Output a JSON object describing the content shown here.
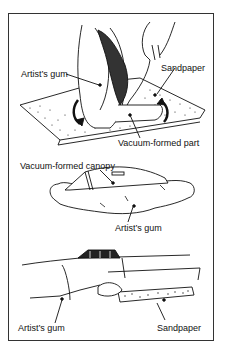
{
  "figure": {
    "panels": [
      {
        "id": "panel-1",
        "description": "Hands holding a vacuum-formed part with artist's gum and rubbing it on sandpaper",
        "labels": [
          {
            "text": "Artist’s gum"
          },
          {
            "text": "Sandpaper"
          },
          {
            "text": "Vacuum-formed part"
          }
        ]
      },
      {
        "id": "panel-2",
        "description": "Vacuum-formed canopy seated in a mound of artist's gum",
        "labels": [
          {
            "text": "Vacuum-formed canopy"
          },
          {
            "text": "Artist’s gum"
          }
        ]
      },
      {
        "id": "panel-3",
        "description": "Fuselage with canopy; sandpaper held against a part backed by artist's gum",
        "labels": [
          {
            "text": "Artist’s gum"
          },
          {
            "text": "Sandpaper"
          }
        ]
      }
    ]
  },
  "colors": {
    "ink": "#111111",
    "frame": "#333333",
    "background": "#ffffff"
  }
}
